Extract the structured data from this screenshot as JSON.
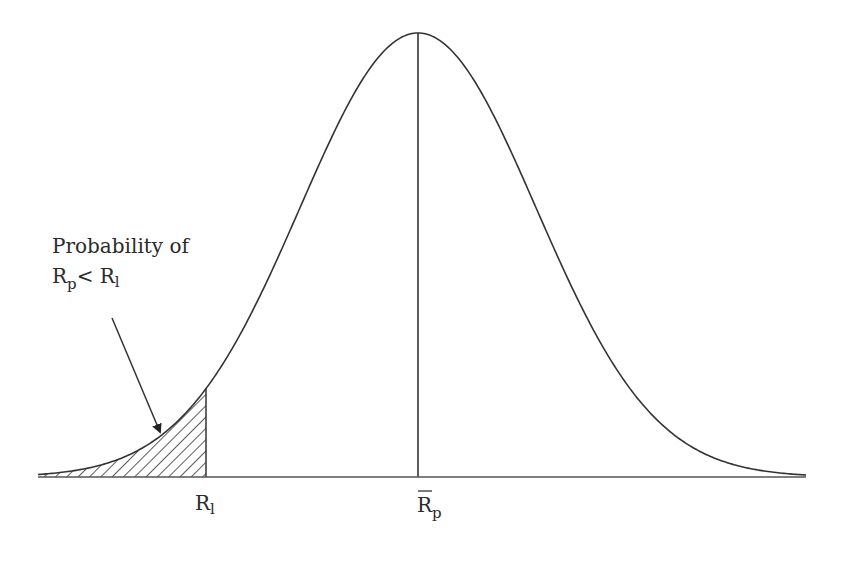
{
  "diagram": {
    "type": "normal-distribution-shaded-tail",
    "annotation": {
      "line1": "Probability of",
      "line2_main_a": "R",
      "line2_sub_a": "p",
      "line2_op": "< R",
      "line2_sub_b": "l"
    },
    "axis_labels": {
      "left_threshold": {
        "main": "R",
        "sub": "l"
      },
      "mean": {
        "main": "R",
        "sub": "p",
        "overbar": true
      }
    },
    "colors": {
      "stroke": "#333333",
      "text": "#2b2b2b",
      "background": "#ffffff"
    }
  },
  "chart_data": {
    "type": "area",
    "title": "",
    "distribution": {
      "mean_label": "R̄p",
      "threshold_label": "Rl",
      "shaded_region": "x < Rl"
    },
    "xlabel": "",
    "ylabel": "",
    "grid": false
  }
}
